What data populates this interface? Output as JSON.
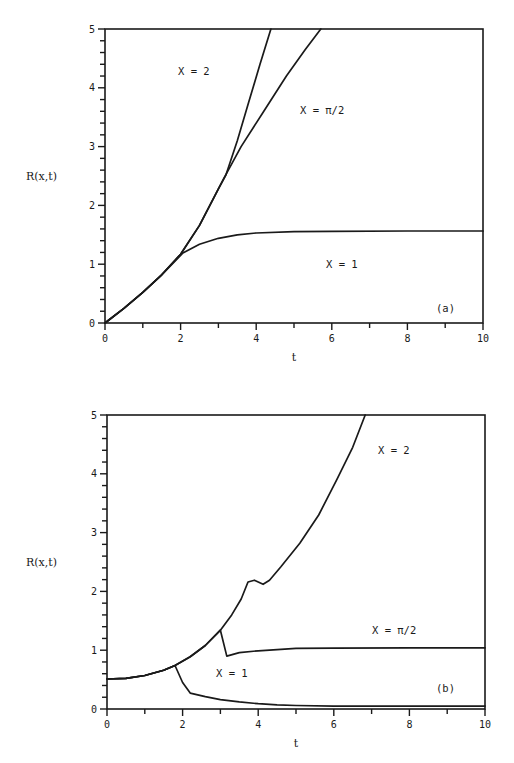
{
  "chart_data": [
    {
      "type": "line",
      "panel_label": "(a)",
      "xlabel": "t",
      "ylabel": "R(x,t)",
      "xlim": [
        0,
        10
      ],
      "ylim": [
        0,
        5
      ],
      "xticks": [
        0,
        2,
        4,
        6,
        8,
        10
      ],
      "xtick_labels": [
        "0",
        "2",
        "4",
        "6",
        "8",
        "10"
      ],
      "yticks": [
        0,
        1,
        2,
        3,
        4,
        5
      ],
      "ytick_labels": [
        "0",
        "1",
        "2",
        "3",
        "4",
        "5"
      ],
      "x_minor_step": 1,
      "y_minor_step": 0.2,
      "grid": false,
      "box": {
        "left": 105,
        "top": 29,
        "right": 483,
        "bottom": 323
      },
      "series": [
        {
          "name": "X = 2",
          "x": [
            0,
            0.5,
            1.0,
            1.5,
            2.0,
            2.5,
            3.0,
            3.2,
            3.5,
            3.8,
            4.1,
            4.39
          ],
          "y": [
            0,
            0.25,
            0.52,
            0.82,
            1.17,
            1.66,
            2.28,
            2.52,
            3.1,
            3.75,
            4.4,
            5.0
          ]
        },
        {
          "name": "X = π/2",
          "x": [
            0,
            0.5,
            1.0,
            1.5,
            2.0,
            2.5,
            3.0,
            3.15,
            3.6,
            4.2,
            4.8,
            5.3,
            5.71
          ],
          "y": [
            0,
            0.25,
            0.52,
            0.82,
            1.17,
            1.66,
            2.28,
            2.47,
            3.0,
            3.6,
            4.2,
            4.65,
            5.0
          ]
        },
        {
          "name": "X = 1",
          "x": [
            0,
            0.5,
            1.0,
            1.5,
            2.06,
            2.5,
            3.0,
            3.5,
            4.0,
            5.0,
            6.0,
            8.0,
            10.0
          ],
          "y": [
            0,
            0.25,
            0.52,
            0.82,
            1.19,
            1.34,
            1.44,
            1.5,
            1.53,
            1.555,
            1.56,
            1.565,
            1.565
          ]
        }
      ],
      "annotations": [
        {
          "text": "X = 2",
          "px": 178,
          "py": 75
        },
        {
          "text": "X = π/2",
          "px": 300,
          "py": 114
        },
        {
          "text": "X = 1",
          "px": 326,
          "py": 268
        },
        {
          "text": "(a)",
          "px": 436,
          "py": 312
        }
      ]
    },
    {
      "type": "line",
      "panel_label": "(b)",
      "xlabel": "t",
      "ylabel": "R(x,t)",
      "xlim": [
        0,
        10
      ],
      "ylim": [
        0,
        5
      ],
      "xticks": [
        0,
        2,
        4,
        6,
        8,
        10
      ],
      "xtick_labels": [
        "0",
        "2",
        "4",
        "6",
        "8",
        "10"
      ],
      "yticks": [
        0,
        1,
        2,
        3,
        4,
        5
      ],
      "ytick_labels": [
        "0",
        "1",
        "2",
        "3",
        "4",
        "5"
      ],
      "x_minor_step": 1,
      "y_minor_step": 0.2,
      "grid": false,
      "box": {
        "left": 107,
        "top": 415,
        "right": 485,
        "bottom": 709
      },
      "series": [
        {
          "name": "X = 2",
          "x": [
            0,
            0.5,
            1.0,
            1.5,
            1.8,
            2.2,
            2.6,
            3.0,
            3.3,
            3.55,
            3.73,
            3.9,
            4.13,
            4.3,
            4.6,
            5.1,
            5.6,
            6.08,
            6.5,
            6.83
          ],
          "y": [
            0.51,
            0.52,
            0.57,
            0.66,
            0.74,
            0.89,
            1.08,
            1.34,
            1.6,
            1.87,
            2.16,
            2.19,
            2.12,
            2.19,
            2.42,
            2.82,
            3.3,
            3.9,
            4.45,
            5.0
          ]
        },
        {
          "name": "X = π/2",
          "x": [
            0,
            0.5,
            1.0,
            1.5,
            1.8,
            2.2,
            2.6,
            3.0,
            3.17,
            3.5,
            4.0,
            4.5,
            5.0,
            6.0,
            8.0,
            10.0
          ],
          "y": [
            0.51,
            0.52,
            0.57,
            0.66,
            0.74,
            0.89,
            1.08,
            1.34,
            0.9,
            0.96,
            0.99,
            1.01,
            1.03,
            1.035,
            1.04,
            1.04
          ]
        },
        {
          "name": "X = 1",
          "x": [
            0,
            0.5,
            1.0,
            1.5,
            1.8,
            2.0,
            2.2,
            2.6,
            3.0,
            3.5,
            4.0,
            4.5,
            5.0,
            6.0,
            8.0,
            10.0
          ],
          "y": [
            0.51,
            0.52,
            0.57,
            0.66,
            0.74,
            0.45,
            0.27,
            0.21,
            0.16,
            0.12,
            0.09,
            0.07,
            0.06,
            0.05,
            0.05,
            0.05
          ]
        }
      ],
      "annotations": [
        {
          "text": "X = 2",
          "px": 378,
          "py": 454
        },
        {
          "text": "X = π/2",
          "px": 372,
          "py": 634
        },
        {
          "text": "X = 1",
          "px": 216,
          "py": 677
        },
        {
          "text": "(b)",
          "px": 436,
          "py": 692
        }
      ]
    }
  ]
}
